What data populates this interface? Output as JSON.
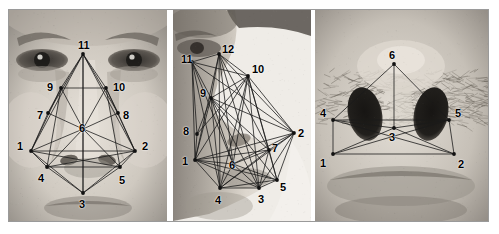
{
  "figure": {
    "panel_count": 3,
    "border_color": "#9a9a9a",
    "background_color": "#ffffff",
    "node_color": "#111111",
    "edge_color": "#1a1a1a",
    "label_color": "#000000"
  },
  "panels": [
    {
      "id": "frontal",
      "caption": "Frontal face view with 11 landmark nodes",
      "image": "grayscale-frontal-face-photo",
      "node_count": 11,
      "nodes": [
        {
          "label": "1",
          "x": 22,
          "y": 141,
          "label_x": 8,
          "label_y": 131
        },
        {
          "label": "2",
          "x": 126,
          "y": 141,
          "label_x": 133,
          "label_y": 131
        },
        {
          "label": "3",
          "x": 74,
          "y": 183,
          "label_x": 70,
          "label_y": 189
        },
        {
          "label": "4",
          "x": 38,
          "y": 157,
          "label_x": 29,
          "label_y": 163
        },
        {
          "label": "5",
          "x": 111,
          "y": 157,
          "label_x": 110,
          "label_y": 165
        },
        {
          "label": "6",
          "x": 74,
          "y": 119,
          "label_x": 70,
          "label_y": 113
        },
        {
          "label": "7",
          "x": 39,
          "y": 103,
          "label_x": 28,
          "label_y": 100
        },
        {
          "label": "8",
          "x": 109,
          "y": 103,
          "label_x": 114,
          "label_y": 100
        },
        {
          "label": "9",
          "x": 52,
          "y": 78,
          "label_x": 38,
          "label_y": 72
        },
        {
          "label": "10",
          "x": 97,
          "y": 78,
          "label_x": 104,
          "label_y": 72
        },
        {
          "label": "11",
          "x": 74,
          "y": 44,
          "label_x": 69,
          "label_y": 30
        }
      ],
      "edges": [
        [
          1,
          2
        ],
        [
          1,
          3
        ],
        [
          1,
          4
        ],
        [
          1,
          5
        ],
        [
          1,
          6
        ],
        [
          1,
          7
        ],
        [
          1,
          9
        ],
        [
          1,
          11
        ],
        [
          2,
          3
        ],
        [
          2,
          4
        ],
        [
          2,
          5
        ],
        [
          2,
          6
        ],
        [
          2,
          8
        ],
        [
          2,
          10
        ],
        [
          2,
          11
        ],
        [
          3,
          4
        ],
        [
          3,
          5
        ],
        [
          3,
          6
        ],
        [
          3,
          11
        ],
        [
          4,
          5
        ],
        [
          4,
          6
        ],
        [
          4,
          9
        ],
        [
          5,
          6
        ],
        [
          5,
          10
        ],
        [
          6,
          7
        ],
        [
          6,
          8
        ],
        [
          6,
          9
        ],
        [
          6,
          10
        ],
        [
          6,
          11
        ],
        [
          7,
          9
        ],
        [
          7,
          11
        ],
        [
          8,
          10
        ],
        [
          8,
          11
        ],
        [
          9,
          10
        ],
        [
          9,
          11
        ],
        [
          10,
          11
        ]
      ]
    },
    {
      "id": "profile",
      "caption": "Profile face view with 12 landmark nodes and dense graph",
      "image": "grayscale-profile-face-photo",
      "node_count": 12,
      "nodes": [
        {
          "label": "1",
          "x": 22,
          "y": 150,
          "label_x": 9,
          "label_y": 146
        },
        {
          "label": "2",
          "x": 121,
          "y": 123,
          "label_x": 125,
          "label_y": 118
        },
        {
          "label": "3",
          "x": 86,
          "y": 178,
          "label_x": 85,
          "label_y": 184
        },
        {
          "label": "4",
          "x": 47,
          "y": 178,
          "label_x": 42,
          "label_y": 185
        },
        {
          "label": "5",
          "x": 104,
          "y": 170,
          "label_x": 107,
          "label_y": 172
        },
        {
          "label": "6",
          "x": 60,
          "y": 154,
          "label_x": 56,
          "label_y": 150
        },
        {
          "label": "7",
          "x": 96,
          "y": 140,
          "label_x": 99,
          "label_y": 133
        },
        {
          "label": "8",
          "x": 24,
          "y": 124,
          "label_x": 10,
          "label_y": 116
        },
        {
          "label": "9",
          "x": 38,
          "y": 88,
          "label_x": 27,
          "label_y": 78
        },
        {
          "label": "10",
          "x": 75,
          "y": 66,
          "label_x": 79,
          "label_y": 54
        },
        {
          "label": "11",
          "x": 19,
          "y": 52,
          "label_x": 8,
          "label_y": 44
        },
        {
          "label": "12",
          "x": 46,
          "y": 44,
          "label_x": 49,
          "label_y": 34
        }
      ],
      "edges": [
        [
          1,
          2
        ],
        [
          1,
          3
        ],
        [
          1,
          4
        ],
        [
          1,
          5
        ],
        [
          1,
          6
        ],
        [
          1,
          7
        ],
        [
          1,
          8
        ],
        [
          1,
          9
        ],
        [
          1,
          10
        ],
        [
          1,
          11
        ],
        [
          1,
          12
        ],
        [
          2,
          3
        ],
        [
          2,
          4
        ],
        [
          2,
          5
        ],
        [
          2,
          6
        ],
        [
          2,
          7
        ],
        [
          2,
          9
        ],
        [
          2,
          10
        ],
        [
          2,
          11
        ],
        [
          2,
          12
        ],
        [
          3,
          4
        ],
        [
          3,
          5
        ],
        [
          3,
          6
        ],
        [
          3,
          7
        ],
        [
          3,
          9
        ],
        [
          3,
          10
        ],
        [
          3,
          12
        ],
        [
          4,
          5
        ],
        [
          4,
          6
        ],
        [
          4,
          7
        ],
        [
          4,
          9
        ],
        [
          4,
          10
        ],
        [
          4,
          11
        ],
        [
          4,
          12
        ],
        [
          5,
          6
        ],
        [
          5,
          7
        ],
        [
          5,
          9
        ],
        [
          5,
          10
        ],
        [
          6,
          7
        ],
        [
          6,
          9
        ],
        [
          6,
          10
        ],
        [
          6,
          11
        ],
        [
          6,
          12
        ],
        [
          7,
          9
        ],
        [
          7,
          10
        ],
        [
          7,
          12
        ],
        [
          8,
          9
        ],
        [
          8,
          10
        ],
        [
          8,
          11
        ],
        [
          9,
          10
        ],
        [
          9,
          11
        ],
        [
          9,
          12
        ],
        [
          10,
          11
        ],
        [
          10,
          12
        ],
        [
          11,
          12
        ]
      ]
    },
    {
      "id": "nose",
      "caption": "Nose close-up view with 6 landmark nodes",
      "image": "grayscale-nose-closeup-photo",
      "node_count": 6,
      "nodes": [
        {
          "label": "1",
          "x": 18,
          "y": 144,
          "label_x": 5,
          "label_y": 148
        },
        {
          "label": "2",
          "x": 139,
          "y": 144,
          "label_x": 143,
          "label_y": 149
        },
        {
          "label": "3",
          "x": 79,
          "y": 118,
          "label_x": 74,
          "label_y": 122
        },
        {
          "label": "4",
          "x": 18,
          "y": 110,
          "label_x": 5,
          "label_y": 98
        },
        {
          "label": "5",
          "x": 134,
          "y": 110,
          "label_x": 140,
          "label_y": 98
        },
        {
          "label": "6",
          "x": 79,
          "y": 54,
          "label_x": 74,
          "label_y": 40
        }
      ],
      "edges": [
        [
          1,
          2
        ],
        [
          1,
          3
        ],
        [
          1,
          4
        ],
        [
          1,
          5
        ],
        [
          2,
          3
        ],
        [
          2,
          4
        ],
        [
          2,
          5
        ],
        [
          3,
          4
        ],
        [
          3,
          5
        ],
        [
          3,
          6
        ],
        [
          4,
          5
        ],
        [
          4,
          6
        ],
        [
          5,
          6
        ]
      ]
    }
  ]
}
